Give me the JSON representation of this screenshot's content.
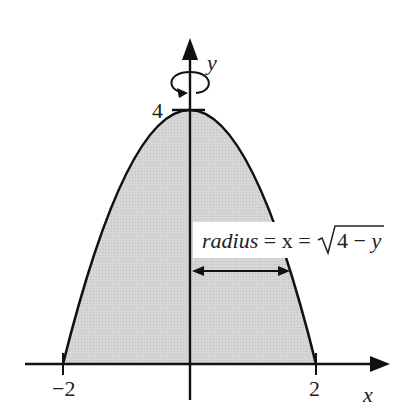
{
  "diagram": {
    "type": "solid-of-revolution",
    "function": "y = 4 - x^2",
    "axis_of_rotation": "y",
    "labels": {
      "x_axis": "x",
      "y_axis": "y",
      "tick_neg2": "−2",
      "tick_2": "2",
      "tick_4": "4",
      "radius_word": "radius",
      "eq1": " = x = ",
      "sqrt_content": "4 − y"
    },
    "colors": {
      "fill": "#d3d3d3",
      "stroke": "#111111",
      "background": "#ffffff"
    },
    "x_range": [
      -2,
      2
    ],
    "y_max": 4
  }
}
